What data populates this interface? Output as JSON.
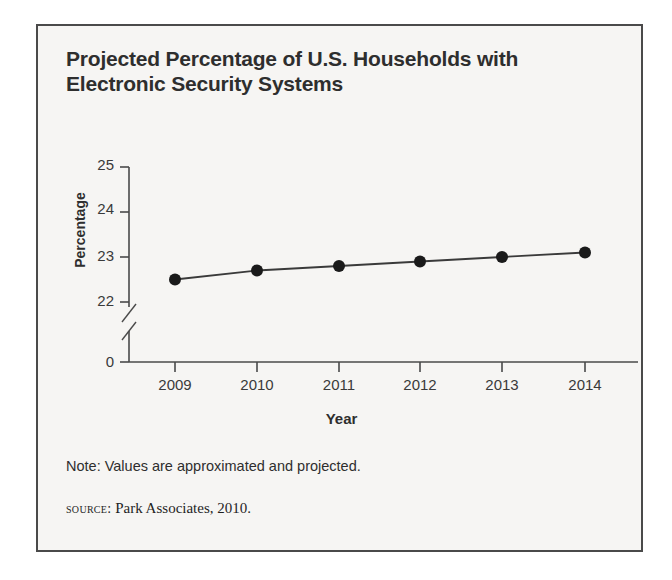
{
  "figure": {
    "title": "Projected Percentage of U.S. Households with Electronic Security Systems",
    "note": "Note: Values are approximated and projected.",
    "source_prefix": "source:",
    "source_text": "Park Associates, 2010.",
    "border_color": "#4a4a4a",
    "background_color": "#f6f5f3",
    "text_color": "#2e2e2e"
  },
  "chart_data": {
    "type": "line",
    "title": "Projected Percentage of U.S. Households with Electronic Security Systems",
    "xlabel": "Year",
    "ylabel": "Percentage",
    "categories": [
      "2009",
      "2010",
      "2011",
      "2012",
      "2013",
      "2014"
    ],
    "values": [
      22.5,
      22.7,
      22.8,
      22.9,
      23.0,
      23.1
    ],
    "x": [
      2009,
      2010,
      2011,
      2012,
      2013,
      2014
    ],
    "ytick_labels": [
      "25",
      "24",
      "23",
      "22",
      "0"
    ],
    "ytick_values": [
      25,
      24,
      23,
      22,
      0
    ],
    "ylim": [
      22,
      25
    ],
    "axis_break": true,
    "axis_break_note": "y-axis broken between 0 and 22",
    "grid": false,
    "legend": "none",
    "marker": "filled-circle",
    "line_color": "#3a3a3a",
    "marker_color": "#1a1a1a"
  }
}
